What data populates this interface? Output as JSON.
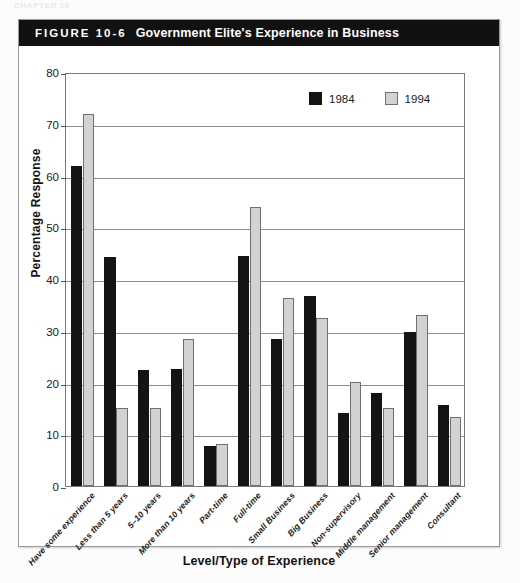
{
  "page": {
    "running_head": "CHAPTER 10"
  },
  "figure": {
    "number": "FIGURE 10-6",
    "title": "Government Elite's Experience in Business"
  },
  "legend": {
    "position": "top-right",
    "items": [
      {
        "label": "1984",
        "color": "#141414"
      },
      {
        "label": "1994",
        "color": "#d2d2d2"
      }
    ]
  },
  "chart_data": {
    "type": "bar",
    "title": "Government Elite's Experience in Business",
    "xlabel": "Level/Type of Experience",
    "ylabel": "Percentage Response",
    "ylim": [
      0,
      80
    ],
    "yticks": [
      0,
      10,
      20,
      30,
      40,
      50,
      60,
      70,
      80
    ],
    "grid": true,
    "legend_position": "top-right",
    "categories": [
      "Have some experience",
      "Less than 5 years",
      "5–10 years",
      "More than 10 years",
      "Part-time",
      "Full-time",
      "Small Business",
      "Big Business",
      "Non-supervisory",
      "Middle management",
      "Senior management",
      "Consultant"
    ],
    "series": [
      {
        "name": "1984",
        "color": "#141414",
        "values": [
          61.8,
          44.2,
          22.5,
          22.7,
          7.7,
          44.4,
          28.5,
          36.8,
          14.2,
          18.0,
          29.8,
          15.6
        ]
      },
      {
        "name": "1994",
        "color": "#d2d2d2",
        "values": [
          71.8,
          15.0,
          15.1,
          28.4,
          8.2,
          54.0,
          36.3,
          32.4,
          20.1,
          15.0,
          33.1,
          13.4
        ]
      }
    ]
  }
}
